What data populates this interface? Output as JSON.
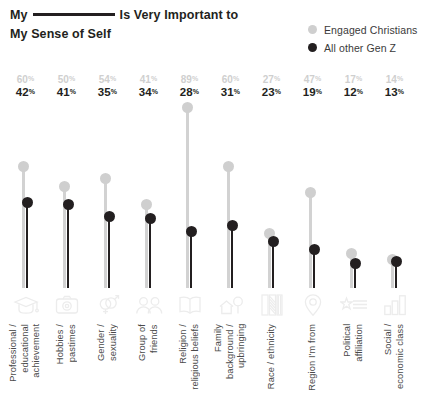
{
  "title": {
    "line1_before": "My",
    "line1_after": "Is Very Important to",
    "line2": "My Sense of Self",
    "blank_rule": true
  },
  "legend": {
    "items": [
      {
        "label": "Engaged Christians",
        "color": "#cfcfcf",
        "icon": "circle-icon"
      },
      {
        "label": "All other Gen Z",
        "color": "#231f20",
        "icon": "circle-icon"
      }
    ]
  },
  "colors": {
    "engaged_christians": "#cfcfcf",
    "all_other_gen_z": "#231f20",
    "icon": "#ececec",
    "text": "#231f20"
  },
  "percent_symbol": "%",
  "chart_data": {
    "type": "bar",
    "subtype": "lollipop",
    "xlabel": "",
    "ylabel": "",
    "ylim": [
      0,
      100
    ],
    "grid": false,
    "legend_position": "top-right",
    "value_suffix": "%",
    "categories": [
      "Professional /\neducational\nachievement",
      "Hobbies /\npastimes",
      "Gender /\nsexuality",
      "Group of\nfriends",
      "Religion /\nreligious beliefs",
      "Family\nbackground /\nupbringing",
      "Race / ethnicity",
      "Region I'm from",
      "Political\naffiliation",
      "Social /\neconomic class"
    ],
    "category_icons": [
      "graduation-cap-icon",
      "camera-icon",
      "gender-symbols-icon",
      "two-people-icon",
      "open-book-icon",
      "house-and-tree-icon",
      "flag-banner-icon",
      "location-pin-icon",
      "ballot-star-icon",
      "bar-chart-icon"
    ],
    "series": [
      {
        "name": "Engaged Christians",
        "color": "#cfcfcf",
        "values": [
          60,
          50,
          54,
          41,
          89,
          60,
          27,
          47,
          17,
          14
        ]
      },
      {
        "name": "All other Gen Z",
        "color": "#231f20",
        "values": [
          42,
          41,
          35,
          34,
          28,
          31,
          23,
          19,
          12,
          13
        ]
      }
    ]
  }
}
